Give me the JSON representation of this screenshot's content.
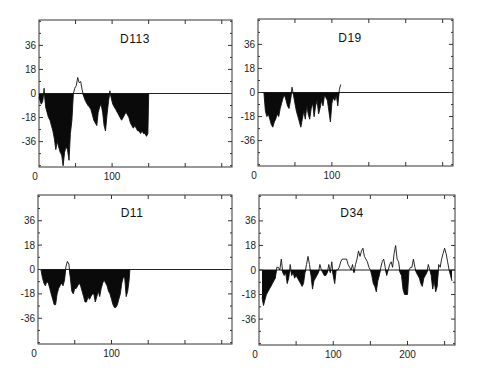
{
  "figure": {
    "panel_titles": [
      "D113",
      "D19",
      "D11",
      "D34"
    ]
  },
  "chart_data": [
    {
      "type": "area",
      "title": "D113",
      "xlabel": "",
      "ylabel": "",
      "x_ticks": [
        0,
        100
      ],
      "y_ticks": [
        36,
        18,
        0,
        -18,
        -36
      ],
      "xlim": [
        0,
        264
      ],
      "ylim": [
        -55,
        55
      ],
      "grid": false,
      "fill_below_zero": true,
      "frame": {
        "left": 39,
        "top": 20,
        "right": 232,
        "bottom": 167
      },
      "x": [
        0,
        3,
        5,
        7,
        9,
        11,
        13,
        15,
        17,
        19,
        21,
        23,
        25,
        27,
        29,
        31,
        33,
        35,
        37,
        39,
        41,
        43,
        45,
        47,
        49,
        51,
        53,
        55,
        57,
        59,
        61,
        63,
        65,
        67,
        69,
        71,
        73,
        75,
        77,
        79,
        81,
        83,
        85,
        87,
        89,
        91,
        93,
        95,
        97,
        99,
        101,
        103,
        105,
        107,
        109,
        111,
        113,
        115,
        117,
        119,
        121,
        123,
        125,
        127,
        129,
        131,
        133,
        135,
        137,
        139,
        141,
        143,
        145,
        147,
        149,
        150
      ],
      "values": [
        -3,
        -8,
        -6,
        4,
        -10,
        -14,
        -18,
        -20,
        -24,
        -28,
        -34,
        -42,
        -36,
        -40,
        -44,
        -46,
        -54,
        -44,
        -40,
        -42,
        -50,
        -30,
        -20,
        0,
        4,
        6,
        12,
        8,
        9,
        3,
        -2,
        -5,
        -7,
        -9,
        -10,
        -12,
        -16,
        -20,
        -22,
        -24,
        -14,
        -10,
        -8,
        -14,
        -24,
        -28,
        -16,
        -6,
        2,
        -4,
        -8,
        -10,
        -12,
        -14,
        -16,
        -18,
        -20,
        -18,
        -16,
        -14,
        -16,
        -18,
        -22,
        -24,
        -26,
        -24,
        -26,
        -28,
        -28,
        -30,
        -28,
        -30,
        -30,
        -32,
        -30,
        0
      ]
    },
    {
      "type": "area",
      "title": "D19",
      "xlabel": "",
      "ylabel": "",
      "x_ticks": [
        0,
        100
      ],
      "y_ticks": [
        36,
        18,
        0,
        -18,
        -36
      ],
      "xlim": [
        0,
        264
      ],
      "ylim": [
        -55,
        55
      ],
      "grid": false,
      "fill_below_zero": true,
      "frame": {
        "left": 258,
        "top": 19,
        "right": 453,
        "bottom": 166
      },
      "x": [
        8,
        10,
        12,
        14,
        16,
        18,
        20,
        22,
        24,
        26,
        28,
        30,
        32,
        34,
        36,
        38,
        40,
        42,
        44,
        46,
        48,
        50,
        52,
        54,
        56,
        58,
        60,
        62,
        64,
        66,
        68,
        70,
        72,
        74,
        76,
        78,
        80,
        82,
        84,
        86,
        88,
        90,
        92,
        94,
        96,
        98,
        100,
        102,
        104,
        106,
        108,
        110,
        112
      ],
      "values": [
        0,
        -14,
        -18,
        -16,
        -20,
        -24,
        -26,
        -22,
        -20,
        -16,
        -18,
        -12,
        -8,
        -4,
        -2,
        -6,
        -10,
        -12,
        -6,
        4,
        -2,
        -8,
        -14,
        -18,
        -22,
        -26,
        -20,
        -14,
        -20,
        -10,
        -16,
        -20,
        -12,
        -8,
        -18,
        -10,
        -6,
        -16,
        -12,
        -6,
        -10,
        -2,
        -4,
        -6,
        -14,
        -22,
        -8,
        -4,
        -6,
        -2,
        -10,
        2,
        6
      ]
    },
    {
      "type": "area",
      "title": "D11",
      "xlabel": "",
      "ylabel": "",
      "x_ticks": [
        0,
        100
      ],
      "y_ticks": [
        36,
        18,
        0,
        -18,
        -36
      ],
      "xlim": [
        0,
        264
      ],
      "ylim": [
        -55,
        55
      ],
      "grid": false,
      "fill_below_zero": true,
      "frame": {
        "left": 38,
        "top": 195,
        "right": 232,
        "bottom": 344
      },
      "x": [
        4,
        6,
        8,
        10,
        12,
        14,
        16,
        18,
        20,
        22,
        24,
        26,
        28,
        30,
        32,
        34,
        36,
        38,
        40,
        42,
        44,
        46,
        48,
        50,
        52,
        54,
        56,
        58,
        60,
        62,
        64,
        66,
        68,
        70,
        72,
        74,
        76,
        78,
        80,
        82,
        84,
        86,
        88,
        90,
        92,
        94,
        96,
        98,
        100,
        102,
        104,
        106,
        108,
        110,
        112,
        114,
        116,
        118,
        120,
        122,
        124,
        125
      ],
      "values": [
        0,
        -6,
        -10,
        -12,
        -9,
        -10,
        -14,
        -18,
        -22,
        -26,
        -26,
        -18,
        -14,
        -12,
        -10,
        -12,
        -8,
        2,
        6,
        4,
        -6,
        -16,
        -18,
        -14,
        -14,
        -12,
        -10,
        -12,
        -16,
        -20,
        -24,
        -24,
        -20,
        -22,
        -20,
        -18,
        -18,
        -24,
        -20,
        -16,
        -20,
        -14,
        -10,
        -8,
        -10,
        -12,
        -16,
        -18,
        -22,
        -26,
        -28,
        -28,
        -26,
        -22,
        -18,
        -10,
        -6,
        -6,
        -20,
        -16,
        -8,
        0
      ]
    },
    {
      "type": "area",
      "title": "D34",
      "xlabel": "",
      "ylabel": "",
      "x_ticks": [
        0,
        100,
        200
      ],
      "y_ticks": [
        36,
        18,
        0,
        -18,
        -36
      ],
      "xlim": [
        0,
        264
      ],
      "ylim": [
        -55,
        55
      ],
      "grid": false,
      "fill_below_zero": true,
      "frame": {
        "left": 259,
        "top": 195,
        "right": 455,
        "bottom": 345
      },
      "x": [
        4,
        6,
        8,
        10,
        12,
        14,
        16,
        18,
        20,
        22,
        24,
        26,
        28,
        30,
        32,
        34,
        36,
        38,
        40,
        42,
        44,
        46,
        48,
        50,
        52,
        54,
        56,
        58,
        60,
        62,
        64,
        66,
        68,
        70,
        72,
        74,
        76,
        78,
        80,
        82,
        84,
        86,
        88,
        90,
        92,
        94,
        96,
        98,
        100,
        102,
        104,
        106,
        108,
        110,
        112,
        114,
        116,
        118,
        120,
        122,
        124,
        126,
        128,
        130,
        132,
        134,
        136,
        138,
        140,
        142,
        144,
        146,
        148,
        150,
        152,
        154,
        156,
        158,
        160,
        162,
        164,
        166,
        168,
        170,
        172,
        174,
        176,
        178,
        180,
        182,
        184,
        186,
        188,
        190,
        192,
        194,
        196,
        198,
        200,
        202,
        204,
        206,
        208,
        210,
        212,
        214,
        216,
        218,
        220,
        222,
        224,
        226,
        228,
        230,
        232,
        234,
        236,
        238,
        240,
        242,
        244,
        246,
        248,
        250,
        252,
        254,
        256,
        258,
        260
      ],
      "values": [
        -20,
        -26,
        -22,
        -18,
        -16,
        -14,
        -12,
        -10,
        -8,
        -6,
        2,
        2,
        0,
        8,
        -2,
        -4,
        -2,
        -10,
        -6,
        4,
        -4,
        -2,
        -6,
        -4,
        -6,
        -8,
        -10,
        -12,
        -10,
        -2,
        4,
        10,
        4,
        -4,
        -14,
        -8,
        -6,
        -4,
        -2,
        4,
        0,
        -2,
        -4,
        -4,
        -2,
        4,
        -2,
        6,
        -4,
        -10,
        0,
        0,
        2,
        6,
        8,
        8,
        8,
        8,
        4,
        2,
        0,
        4,
        -2,
        4,
        8,
        14,
        10,
        14,
        16,
        10,
        8,
        6,
        2,
        0,
        -4,
        -10,
        -12,
        -16,
        -8,
        -4,
        2,
        6,
        8,
        2,
        -4,
        0,
        4,
        6,
        2,
        12,
        18,
        8,
        6,
        -2,
        -4,
        -14,
        -18,
        -18,
        -18,
        0,
        2,
        2,
        8,
        2,
        -2,
        -4,
        -6,
        -10,
        -12,
        -6,
        -4,
        -2,
        4,
        0,
        -4,
        -14,
        -8,
        -16,
        -12,
        4,
        2,
        8,
        12,
        16,
        12,
        6,
        0,
        -4,
        -8
      ]
    }
  ]
}
